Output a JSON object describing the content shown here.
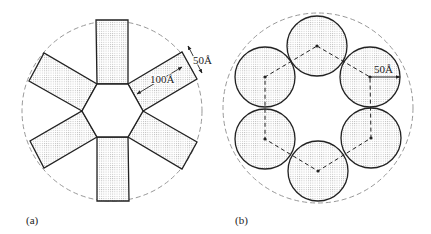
{
  "panels": [
    {
      "id": "a",
      "label": "(a)",
      "label_pos": [
        26,
        224
      ],
      "outer_circle": {
        "cx": 112,
        "cy": 111,
        "r": 90
      },
      "hexagon": [
        [
          97,
          84
        ],
        [
          128,
          84
        ],
        [
          143,
          111
        ],
        [
          128,
          137
        ],
        [
          97,
          137
        ],
        [
          82,
          111
        ]
      ],
      "arms": [
        [
          [
            97,
            84
          ],
          [
            96,
            20
          ],
          [
            128,
            20
          ],
          [
            128,
            84
          ]
        ],
        [
          [
            128,
            84
          ],
          [
            182,
            52
          ],
          [
            197,
            79
          ],
          [
            143,
            111
          ]
        ],
        [
          [
            143,
            111
          ],
          [
            197,
            142
          ],
          [
            182,
            169
          ],
          [
            128,
            137
          ]
        ],
        [
          [
            128,
            137
          ],
          [
            129,
            201
          ],
          [
            97,
            201
          ],
          [
            97,
            137
          ]
        ],
        [
          [
            97,
            137
          ],
          [
            44,
            168
          ],
          [
            30,
            141
          ],
          [
            82,
            111
          ]
        ],
        [
          [
            82,
            111
          ],
          [
            29,
            81
          ],
          [
            44,
            53
          ],
          [
            97,
            84
          ]
        ]
      ],
      "dimensions": [
        {
          "text": "50Å",
          "x": 193,
          "y": 64,
          "line": [
            [
              188,
              46
            ],
            [
              202,
              73
            ]
          ]
        },
        {
          "text": "100Å",
          "x": 150,
          "y": 83,
          "line": [
            [
              182,
              67
            ],
            [
              137,
              94
            ]
          ]
        }
      ]
    },
    {
      "id": "b",
      "label": "(b)",
      "label_pos": [
        235,
        224
      ],
      "outer_circle": {
        "cx": 318,
        "cy": 108,
        "r": 95
      },
      "circle_radius": 30,
      "centers": [
        [
          317,
          46
        ],
        [
          370,
          77
        ],
        [
          371,
          138
        ],
        [
          318,
          171
        ],
        [
          265,
          139
        ],
        [
          265,
          77
        ]
      ],
      "dimensions": [
        {
          "text": "50Å",
          "x": 374,
          "y": 73,
          "line": [
            [
              370,
              77
            ],
            [
              400,
              77
            ]
          ]
        }
      ]
    }
  ],
  "colors": {
    "stroke": "#222222",
    "dashed_outline": "#999999",
    "fill_pattern": "#bbbbbb"
  }
}
